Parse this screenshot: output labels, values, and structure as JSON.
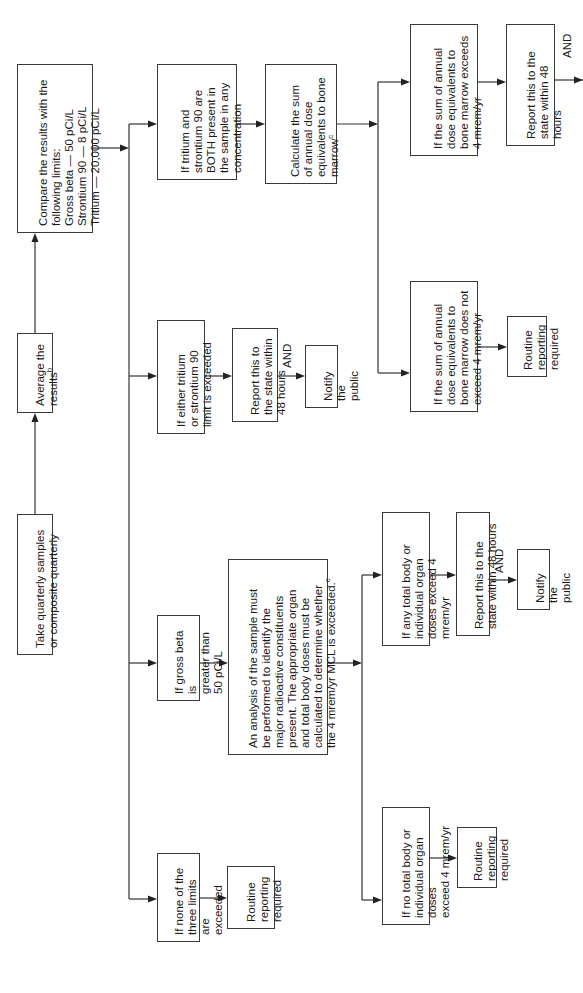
{
  "flowchart": {
    "steps": {
      "take_samples": "Take quarterly samples\nor composite quarterly",
      "average": "Average the\nresults",
      "average_footnote": "b",
      "compare": "Compare the results with the\nfollowing limits:\nGross beta — 50 pCi/L\nStrontium 90 — 8 pCi/L\nTritium — 20,000 pCi/L"
    },
    "branches": {
      "both_present": "If tritium and\nstrontium 90 are\nBOTH present in\nthe sample in any\nconcentration",
      "calculate_sum": "Calculate the sum\nof annual dose\nequivalents to bone\nmarrow",
      "calculate_sum_footnote": "c",
      "bone_exceeds": "If the sum of annual\ndose equivalents to\nbone marrow exceeds\n4 mrem/yr",
      "bone_exceeds_report": "Report this to the\nstate within 48\nhours",
      "bone_not_exceed": "If the sum of annual\ndose equivalents to\nbone marrow does not\nexceed 4 mrem/yr",
      "bone_not_exceed_routine": "Routine\nreporting\nrequired",
      "either_exceeded": "If either tritium\nor strontium 90\nlimit is exceeded",
      "either_report": "Report this to\nthe state within\n48 hours",
      "either_notify": "Notify\nthe public",
      "gross_beta": "If gross beta is\ngreater than\n50 pCi/L",
      "analysis": "An analysis of the sample must\nbe performed to identify the\nmajor radioactive constituents\npresent. The appropriate organ\nand total body doses must be\ncalculated to determine whether\nthe 4 mrem/yr MCL is exceeded.",
      "analysis_footnote": "c",
      "any_total": "If any total body or\nindividual organ\ndoses exceed 4 mrem/yr",
      "any_total_report": "Report this to the\nstate within 48 hours",
      "any_total_notify": "Notify\nthe public",
      "none_exceeded": "If none of the\nthree limits are\nexceeded",
      "none_routine": "Routine\nreporting\nrequired",
      "no_total": "If no total body or\nindividual organ doses\nexceed 4 mrem/yr",
      "no_total_routine": "Routine\nreporting\nrequired"
    },
    "connector_and": "AND"
  }
}
